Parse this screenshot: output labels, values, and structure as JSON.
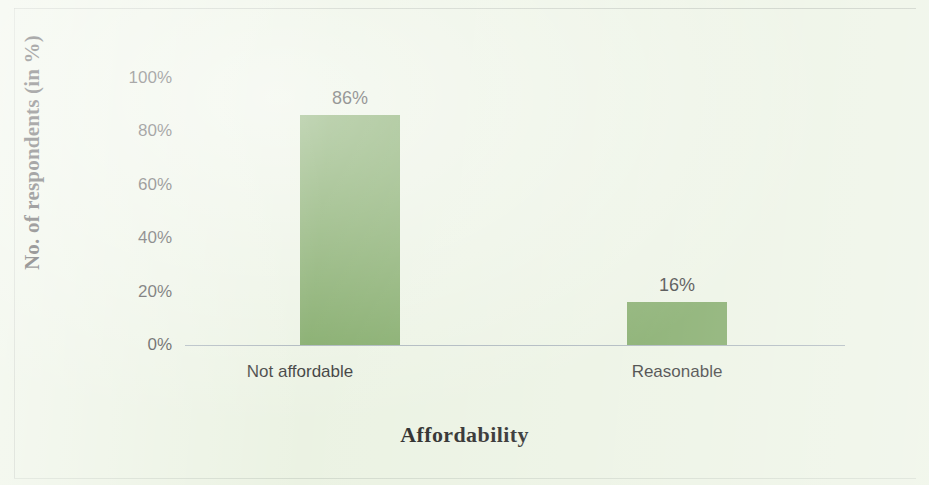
{
  "chart_data": {
    "type": "bar",
    "title": "",
    "xlabel": "Affordability",
    "ylabel": "No. of respondents (in %)",
    "categories": [
      "Not affordable",
      "Reasonable"
    ],
    "values": [
      86,
      16
    ],
    "value_labels": [
      "86%",
      "16%"
    ],
    "ylim": [
      0,
      100
    ],
    "ytick_values": [
      100,
      80,
      60,
      40,
      20,
      0
    ],
    "ytick_labels": [
      "100%",
      "80%",
      "60%",
      "40%",
      "20%",
      "0%"
    ],
    "grid": false,
    "legend": null,
    "bar_color": "#6d9c4f",
    "background_color": "#e9f1e0",
    "axis_line_color": "#9eaab2"
  }
}
